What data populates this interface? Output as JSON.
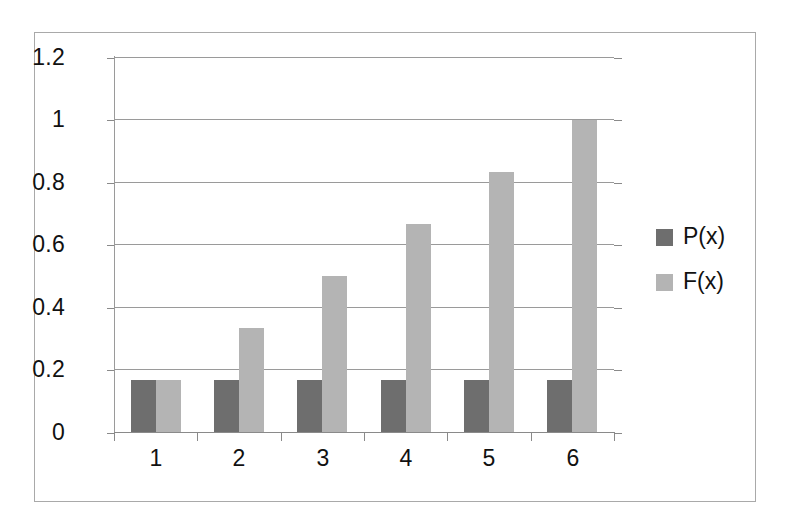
{
  "chart_data": {
    "type": "bar",
    "title": "",
    "subtitle": "",
    "xlabel": "",
    "ylabel": "",
    "categories": [
      "1",
      "2",
      "3",
      "4",
      "5",
      "6"
    ],
    "series": [
      {
        "name": "P(x)",
        "color": "#6e6e6e",
        "values": [
          0.167,
          0.167,
          0.167,
          0.167,
          0.167,
          0.167
        ]
      },
      {
        "name": "F(x)",
        "color": "#b4b4b4",
        "values": [
          0.167,
          0.333,
          0.5,
          0.667,
          0.833,
          1.0
        ]
      }
    ],
    "ylim": [
      0,
      1.2
    ],
    "yticks": [
      0,
      0.2,
      0.4,
      0.6,
      0.8,
      1,
      1.2
    ],
    "ytick_labels": [
      "0",
      "0.2",
      "0.4",
      "0.6",
      "0.8",
      "1",
      "1.2"
    ],
    "grid": true,
    "grid_axis": "y",
    "legend_position": "right",
    "legend": [
      "P(x)",
      "F(x)"
    ],
    "annotations": []
  },
  "colors": {
    "series_p": "#6e6e6e",
    "series_f": "#b4b4b4",
    "gridline": "#9a9a9a",
    "axis": "#8a8a8a",
    "frame": "#a9a9a9",
    "text": "#111111",
    "background": "#ffffff"
  }
}
